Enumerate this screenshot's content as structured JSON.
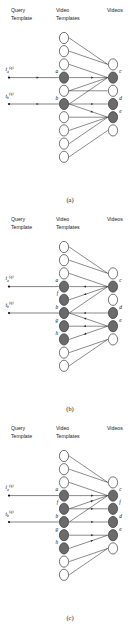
{
  "figure": {
    "caption_a": "(a)",
    "caption_b": "(b)",
    "caption_c": "(c)",
    "columns": {
      "query_line1": "Query",
      "query_line2": "Template",
      "mid_line1": "Video",
      "mid_line2": "Templates",
      "right_line1": "Videos"
    },
    "query_labels": {
      "a_base": "t",
      "a_sub": "a",
      "a_sup": "(q)",
      "b_base": "t",
      "b_sub": "b",
      "b_sup": "(q)"
    },
    "colors": {
      "node_filled": "#6b6b6b",
      "node_open": "#ffffff",
      "stroke": "#2b2b2b",
      "background": "#ffffff"
    }
  },
  "chart_data": {
    "type": "diagram",
    "panels": [
      {
        "id": "a",
        "caption": "(a)",
        "query_nodes": [
          {
            "id": "tq_a",
            "label": "t_a^(q)",
            "row": 4
          },
          {
            "id": "tq_b",
            "label": "t_b^(q)",
            "row": 6
          }
        ],
        "mid_nodes": [
          {
            "row": 1,
            "label": "",
            "state": "open"
          },
          {
            "row": 2,
            "label": "",
            "state": "open"
          },
          {
            "row": 3,
            "label": "",
            "state": "open"
          },
          {
            "row": 4,
            "label": "a",
            "state": "filled"
          },
          {
            "row": 5,
            "label": "",
            "state": "open"
          },
          {
            "row": 6,
            "label": "b",
            "state": "filled"
          },
          {
            "row": 7,
            "label": "",
            "state": "open"
          },
          {
            "row": 8,
            "label": "",
            "state": "open"
          },
          {
            "row": 9,
            "label": "",
            "state": "open"
          },
          {
            "row": 10,
            "label": "",
            "state": "open"
          }
        ],
        "right_nodes": [
          {
            "row": 3,
            "label": "",
            "state": "open"
          },
          {
            "row": 4,
            "label": "c",
            "state": "filled"
          },
          {
            "row": 5,
            "label": "",
            "state": "open"
          },
          {
            "row": 6,
            "label": "d",
            "state": "filled"
          },
          {
            "row": 7,
            "label": "e",
            "state": "filled"
          },
          {
            "row": 8,
            "label": "",
            "state": "open"
          }
        ],
        "query_edges": [
          {
            "from": "tq_a",
            "to": "a",
            "arrow": "right"
          },
          {
            "from": "tq_b",
            "to": "b",
            "arrow": "right"
          }
        ],
        "mid_right_edges": [
          {
            "from_row": 1,
            "to_row": 3,
            "arrow": "none"
          },
          {
            "from_row": 2,
            "to_row": 3,
            "arrow": "none"
          },
          {
            "from_row": 3,
            "to_row": 4,
            "arrow": "none"
          },
          {
            "from_row": 4,
            "to_row": 4,
            "arrow": "right"
          },
          {
            "from_row": 5,
            "to_row": 4,
            "arrow": "none"
          },
          {
            "from_row": 5,
            "to_row": 5,
            "arrow": "none"
          },
          {
            "from_row": 6,
            "to_row": 4,
            "arrow": "none"
          },
          {
            "from_row": 6,
            "to_row": 6,
            "arrow": "right"
          },
          {
            "from_row": 6,
            "to_row": 7,
            "arrow": "right"
          },
          {
            "from_row": 7,
            "to_row": 7,
            "arrow": "none"
          },
          {
            "from_row": 8,
            "to_row": 7,
            "arrow": "none"
          },
          {
            "from_row": 9,
            "to_row": 7,
            "arrow": "none"
          },
          {
            "from_row": 10,
            "to_row": 8,
            "arrow": "none"
          }
        ]
      },
      {
        "id": "b",
        "caption": "(b)",
        "query_nodes": [
          {
            "id": "tq_a",
            "label": "t_a^(q)",
            "row": 4
          },
          {
            "id": "tq_b",
            "label": "t_b^(q)",
            "row": 6
          }
        ],
        "mid_nodes": [
          {
            "row": 1,
            "label": "",
            "state": "open"
          },
          {
            "row": 2,
            "label": "",
            "state": "open"
          },
          {
            "row": 3,
            "label": "",
            "state": "open"
          },
          {
            "row": 4,
            "label": "a",
            "state": "filled"
          },
          {
            "row": 5,
            "label": "f",
            "state": "filled"
          },
          {
            "row": 6,
            "label": "b",
            "state": "filled"
          },
          {
            "row": 7,
            "label": "g",
            "state": "filled"
          },
          {
            "row": 8,
            "label": "h",
            "state": "filled"
          },
          {
            "row": 9,
            "label": "",
            "state": "open"
          },
          {
            "row": 10,
            "label": "",
            "state": "open"
          }
        ],
        "right_nodes": [
          {
            "row": 3,
            "label": "",
            "state": "open"
          },
          {
            "row": 4,
            "label": "c",
            "state": "filled"
          },
          {
            "row": 5,
            "label": "",
            "state": "open"
          },
          {
            "row": 6,
            "label": "d",
            "state": "filled"
          },
          {
            "row": 7,
            "label": "e",
            "state": "filled"
          },
          {
            "row": 8,
            "label": "",
            "state": "open"
          }
        ],
        "query_edges": [
          {
            "from": "tq_a",
            "to": "a",
            "arrow": "none"
          },
          {
            "from": "tq_b",
            "to": "b",
            "arrow": "none"
          }
        ],
        "mid_right_edges": [
          {
            "from_row": 1,
            "to_row": 3,
            "arrow": "none"
          },
          {
            "from_row": 2,
            "to_row": 3,
            "arrow": "none"
          },
          {
            "from_row": 3,
            "to_row": 4,
            "arrow": "none"
          },
          {
            "from_row": 4,
            "to_row": 4,
            "arrow": "left"
          },
          {
            "from_row": 5,
            "to_row": 4,
            "arrow": "left"
          },
          {
            "from_row": 6,
            "to_row": 4,
            "arrow": "none"
          },
          {
            "from_row": 6,
            "to_row": 6,
            "arrow": "left"
          },
          {
            "from_row": 6,
            "to_row": 7,
            "arrow": "left"
          },
          {
            "from_row": 7,
            "to_row": 7,
            "arrow": "left"
          },
          {
            "from_row": 8,
            "to_row": 7,
            "arrow": "left"
          },
          {
            "from_row": 9,
            "to_row": 8,
            "arrow": "none"
          },
          {
            "from_row": 10,
            "to_row": 8,
            "arrow": "none"
          }
        ]
      },
      {
        "id": "c",
        "caption": "(c)",
        "query_nodes": [
          {
            "id": "tq_a",
            "label": "t_a^(q)",
            "row": 4
          },
          {
            "id": "tq_b",
            "label": "t_b^(q)",
            "row": 6
          }
        ],
        "mid_nodes": [
          {
            "row": 1,
            "label": "",
            "state": "open"
          },
          {
            "row": 2,
            "label": "",
            "state": "open"
          },
          {
            "row": 3,
            "label": "",
            "state": "open"
          },
          {
            "row": 4,
            "label": "a",
            "state": "filled"
          },
          {
            "row": 5,
            "label": "f",
            "state": "filled"
          },
          {
            "row": 6,
            "label": "b",
            "state": "filled"
          },
          {
            "row": 7,
            "label": "g",
            "state": "filled"
          },
          {
            "row": 8,
            "label": "h",
            "state": "filled"
          },
          {
            "row": 9,
            "label": "",
            "state": "open"
          },
          {
            "row": 10,
            "label": "",
            "state": "open"
          }
        ],
        "right_nodes": [
          {
            "row": 3,
            "label": "",
            "state": "open"
          },
          {
            "row": 4,
            "label": "c",
            "state": "filled"
          },
          {
            "row": 5,
            "label": "f",
            "state": "filled"
          },
          {
            "row": 6,
            "label": "d",
            "state": "filled"
          },
          {
            "row": 7,
            "label": "e",
            "state": "filled"
          },
          {
            "row": 8,
            "label": "",
            "state": "open"
          }
        ],
        "query_edges": [
          {
            "from": "tq_a",
            "to": "a",
            "arrow": "none"
          },
          {
            "from": "tq_b",
            "to": "b",
            "arrow": "none"
          }
        ],
        "mid_right_edges": [
          {
            "from_row": 1,
            "to_row": 3,
            "arrow": "none"
          },
          {
            "from_row": 2,
            "to_row": 3,
            "arrow": "none"
          },
          {
            "from_row": 3,
            "to_row": 4,
            "arrow": "none"
          },
          {
            "from_row": 4,
            "to_row": 4,
            "arrow": "right"
          },
          {
            "from_row": 5,
            "to_row": 4,
            "arrow": "right"
          },
          {
            "from_row": 5,
            "to_row": 5,
            "arrow": "right"
          },
          {
            "from_row": 6,
            "to_row": 4,
            "arrow": "none"
          },
          {
            "from_row": 6,
            "to_row": 6,
            "arrow": "right"
          },
          {
            "from_row": 7,
            "to_row": 7,
            "arrow": "right"
          },
          {
            "from_row": 8,
            "to_row": 7,
            "arrow": "right"
          },
          {
            "from_row": 9,
            "to_row": 8,
            "arrow": "none"
          },
          {
            "from_row": 10,
            "to_row": 8,
            "arrow": "none"
          }
        ]
      }
    ]
  }
}
